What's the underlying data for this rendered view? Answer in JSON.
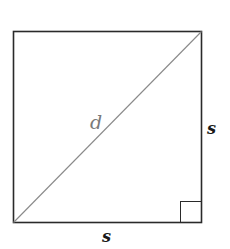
{
  "diagram": {
    "type": "square-with-diagonal",
    "labels": {
      "diagonal": "d",
      "right_side": "s",
      "bottom_side": "s"
    },
    "annotations": {
      "right_angle_marker": "bottom-right corner"
    },
    "colors": {
      "outline": "#2a2a2a",
      "diagonal": "#8a8a8a",
      "diagonal_label": "#7a7a7a",
      "side_label": "#1a1a1a"
    }
  }
}
